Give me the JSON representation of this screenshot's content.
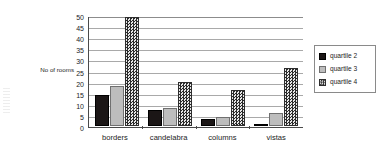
{
  "chart_data": {
    "type": "bar",
    "title": "",
    "subtitle": "",
    "xlabel": "",
    "ylabel": "No of rooms",
    "categories": [
      "borders",
      "candelabra",
      "columns",
      "vistas"
    ],
    "series": [
      {
        "name": "quartile 2",
        "values": [
          14,
          7,
          3,
          1
        ],
        "color": "#1b1616",
        "pattern": "solid-black"
      },
      {
        "name": "quartile 3",
        "values": [
          18,
          8,
          4,
          6
        ],
        "color": "#bdbdbd",
        "pattern": "solid-light-gray"
      },
      {
        "name": "quartile 4",
        "values": [
          49,
          20,
          16,
          26
        ],
        "color": "#6f6f6f",
        "pattern": "checkerboard"
      }
    ],
    "ylim": [
      0,
      50
    ],
    "ytick_step": 5,
    "yticks": [
      0,
      5,
      10,
      15,
      20,
      25,
      30,
      35,
      40,
      45,
      50
    ],
    "ytick_labels": [
      "0",
      "5",
      "10",
      "15",
      "20",
      "25",
      "30",
      "35",
      "40",
      "45",
      "50"
    ],
    "grid": true,
    "grid_axis": "y",
    "legend": true,
    "legend_position": "right",
    "legend_entries": [
      "quartile 2",
      "quartile 3",
      "quartile 4"
    ],
    "annotations": []
  },
  "axes": {
    "y_title": "No of rooms"
  }
}
